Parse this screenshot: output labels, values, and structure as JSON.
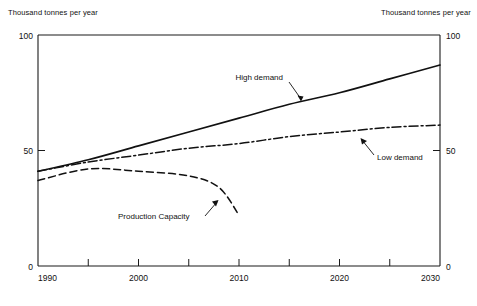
{
  "chart_data": {
    "type": "line",
    "title": "",
    "xlabel": "",
    "ylabel": "Thousand tonnes per year",
    "y2label": "Thousand tonnes per year",
    "xlim": [
      1990,
      2030
    ],
    "ylim": [
      0,
      100
    ],
    "xticks": [
      1990,
      2000,
      2010,
      2020,
      2030
    ],
    "xtick_labels": [
      "1990",
      "2000",
      "2010",
      "2020",
      "2030"
    ],
    "xminor_ticks": [
      1995,
      2005,
      2015,
      2025
    ],
    "yticks": [
      0,
      50,
      100
    ],
    "ytick_labels": [
      "0",
      "50",
      "100"
    ],
    "y2ticks": [
      0,
      50,
      100
    ],
    "y2tick_labels": [
      "0",
      "50",
      "100"
    ],
    "grid": false,
    "legend_position": "inline-annotations",
    "series": [
      {
        "name": "High demand",
        "style": "solid",
        "x": [
          1990,
          1995,
          2000,
          2005,
          2010,
          2015,
          2020,
          2025,
          2030
        ],
        "values": [
          41,
          46,
          52,
          58,
          64,
          70,
          75,
          81,
          87
        ]
      },
      {
        "name": "Low demand",
        "style": "dash-dot",
        "x": [
          1990,
          1995,
          2000,
          2005,
          2010,
          2015,
          2020,
          2025,
          2030
        ],
        "values": [
          41,
          45,
          48,
          51,
          53,
          56,
          58,
          60,
          61
        ]
      },
      {
        "name": "Production Capacity",
        "style": "dashed",
        "x": [
          1990,
          1995,
          2000,
          2005,
          2008,
          2010
        ],
        "values": [
          37,
          42,
          41,
          39,
          34,
          22
        ]
      }
    ],
    "annotations": [
      {
        "text": "High demand",
        "points_to_series": "High demand",
        "at_x": 2014
      },
      {
        "text": "Low demand",
        "points_to_series": "Low demand",
        "at_x": 2026
      },
      {
        "text": "Production Capacity",
        "points_to_series": "Production Capacity",
        "at_x": 2007
      }
    ]
  },
  "axes": {
    "left_caption": "Thousand tonnes per year",
    "right_caption": "Thousand tonnes per year",
    "y_labels": {
      "top": "100",
      "mid": "50",
      "bottom": "0"
    },
    "y2_labels": {
      "top": "100",
      "mid": "50",
      "bottom": "0"
    },
    "x_labels": [
      "1990",
      "2000",
      "2010",
      "2020",
      "2030"
    ]
  },
  "series_labels": {
    "high": "High demand",
    "low": "Low demand",
    "capacity": "Production Capacity"
  }
}
